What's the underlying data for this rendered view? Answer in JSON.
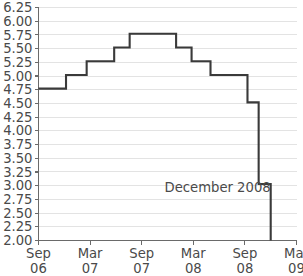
{
  "chart_data": {
    "type": "line",
    "title": "",
    "subtitle": "",
    "xlabel": "",
    "ylabel": "",
    "step": "post",
    "grid": true,
    "legend": null,
    "line_color": "#3a3a3a",
    "grid_color": "#e3e3e3",
    "axis_color": "#6a6a6a",
    "background": "#ffffff",
    "ylim": [
      2.0,
      6.25
    ],
    "ytick_labels": [
      "6.25",
      "6.00",
      "5.75",
      "5.50",
      "5.25",
      "5.00",
      "4.75",
      "4.50",
      "4.25",
      "4.00",
      "3.75",
      "3.50",
      "3.25",
      "3.00",
      "2.75",
      "2.50",
      "2.25",
      "2.00"
    ],
    "ytick_values": [
      6.25,
      6.0,
      5.75,
      5.5,
      5.25,
      5.0,
      4.75,
      4.5,
      4.25,
      4.0,
      3.75,
      3.5,
      3.25,
      3.0,
      2.75,
      2.5,
      2.25,
      2.0
    ],
    "xtick_labels": [
      {
        "month": "Sep",
        "year": "06"
      },
      {
        "month": "Mar",
        "year": "07"
      },
      {
        "month": "Sep",
        "year": "07"
      },
      {
        "month": "Mar",
        "year": "08"
      },
      {
        "month": "Sep",
        "year": "08"
      },
      {
        "month": "Mar",
        "year": "09"
      }
    ],
    "xtick_positions_months": [
      0,
      6,
      12,
      18,
      24,
      30
    ],
    "xlim_months": [
      0,
      30
    ],
    "annotations": [
      {
        "text": "December 2008",
        "x_month": 27,
        "y_value": 2.88
      }
    ],
    "series": [
      {
        "name": "Rate",
        "points": [
          {
            "x_month": 0,
            "value": 4.77
          },
          {
            "x_month": 3.2,
            "value": 5.02
          },
          {
            "x_month": 5.6,
            "value": 5.27
          },
          {
            "x_month": 8.8,
            "value": 5.52
          },
          {
            "x_month": 10.6,
            "value": 5.77
          },
          {
            "x_month": 16.0,
            "value": 5.52
          },
          {
            "x_month": 17.8,
            "value": 5.27
          },
          {
            "x_month": 20.0,
            "value": 5.02
          },
          {
            "x_month": 24.3,
            "value": 4.52
          },
          {
            "x_month": 25.6,
            "value": 3.03
          },
          {
            "x_month": 27.0,
            "value": 2.0
          }
        ]
      }
    ]
  }
}
